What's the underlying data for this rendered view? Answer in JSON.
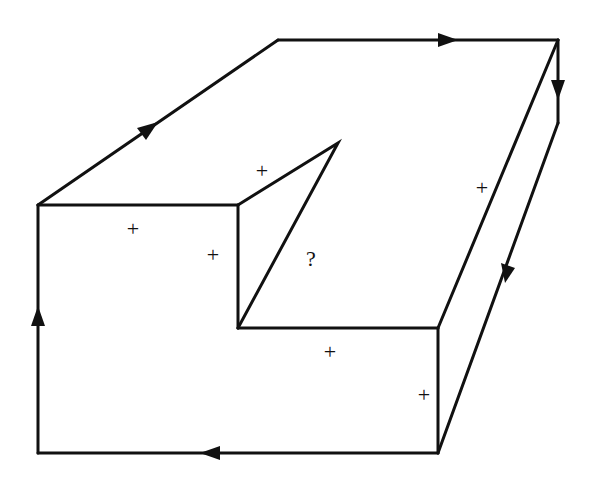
{
  "diagram": {
    "stroke_color": "#111111",
    "background": "#ffffff",
    "labels": [
      {
        "id": "plus-top-face-notch",
        "text": "+",
        "x": 262,
        "y": 178
      },
      {
        "id": "plus-front-top",
        "text": "+",
        "x": 133,
        "y": 236
      },
      {
        "id": "plus-notch-side",
        "text": "+",
        "x": 213,
        "y": 262
      },
      {
        "id": "question-notch-face",
        "text": "?",
        "x": 311,
        "y": 266
      },
      {
        "id": "plus-top-right",
        "text": "+",
        "x": 482,
        "y": 195
      },
      {
        "id": "plus-front-lower",
        "text": "+",
        "x": 330,
        "y": 359
      },
      {
        "id": "plus-front-right",
        "text": "+",
        "x": 424,
        "y": 402
      }
    ]
  }
}
